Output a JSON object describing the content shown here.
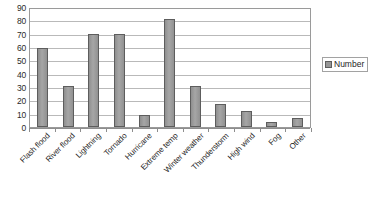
{
  "chart_data": {
    "type": "bar",
    "title": "",
    "subtitle": "",
    "xlabel": "",
    "ylabel": "",
    "categories": [
      "Flash flood",
      "River flood",
      "Lightning",
      "Tornado",
      "Hurricane",
      "Extreme temp",
      "Winter weather",
      "Thunderstorm",
      "High wind",
      "Fog",
      "Other"
    ],
    "series": [
      {
        "name": "Number",
        "values": [
          59,
          31,
          70,
          70,
          9,
          81,
          31,
          17,
          12,
          4,
          7
        ],
        "color": "#969696"
      }
    ],
    "values": [
      59,
      31,
      70,
      70,
      9,
      81,
      31,
      17,
      12,
      4,
      7
    ],
    "ylim": [
      0,
      90
    ],
    "ytick_step": 10,
    "yticks": [
      0,
      10,
      20,
      30,
      40,
      50,
      60,
      70,
      80,
      90
    ],
    "ytick_labels": [
      "0",
      "10",
      "20",
      "30",
      "40",
      "50",
      "60",
      "70",
      "80",
      "90"
    ],
    "grid": true,
    "grid_axis": "y",
    "legend": {
      "position": "right",
      "entries": [
        {
          "label": "Number",
          "color": "#969696"
        }
      ]
    },
    "colors": {
      "bar_fill": "#969696",
      "bar_border": "#5d5d5d",
      "gridline": "#b9b9b9",
      "axis": "#8d8d8d",
      "plot_background": "#ffffff",
      "text": "#1f1f1f"
    }
  }
}
